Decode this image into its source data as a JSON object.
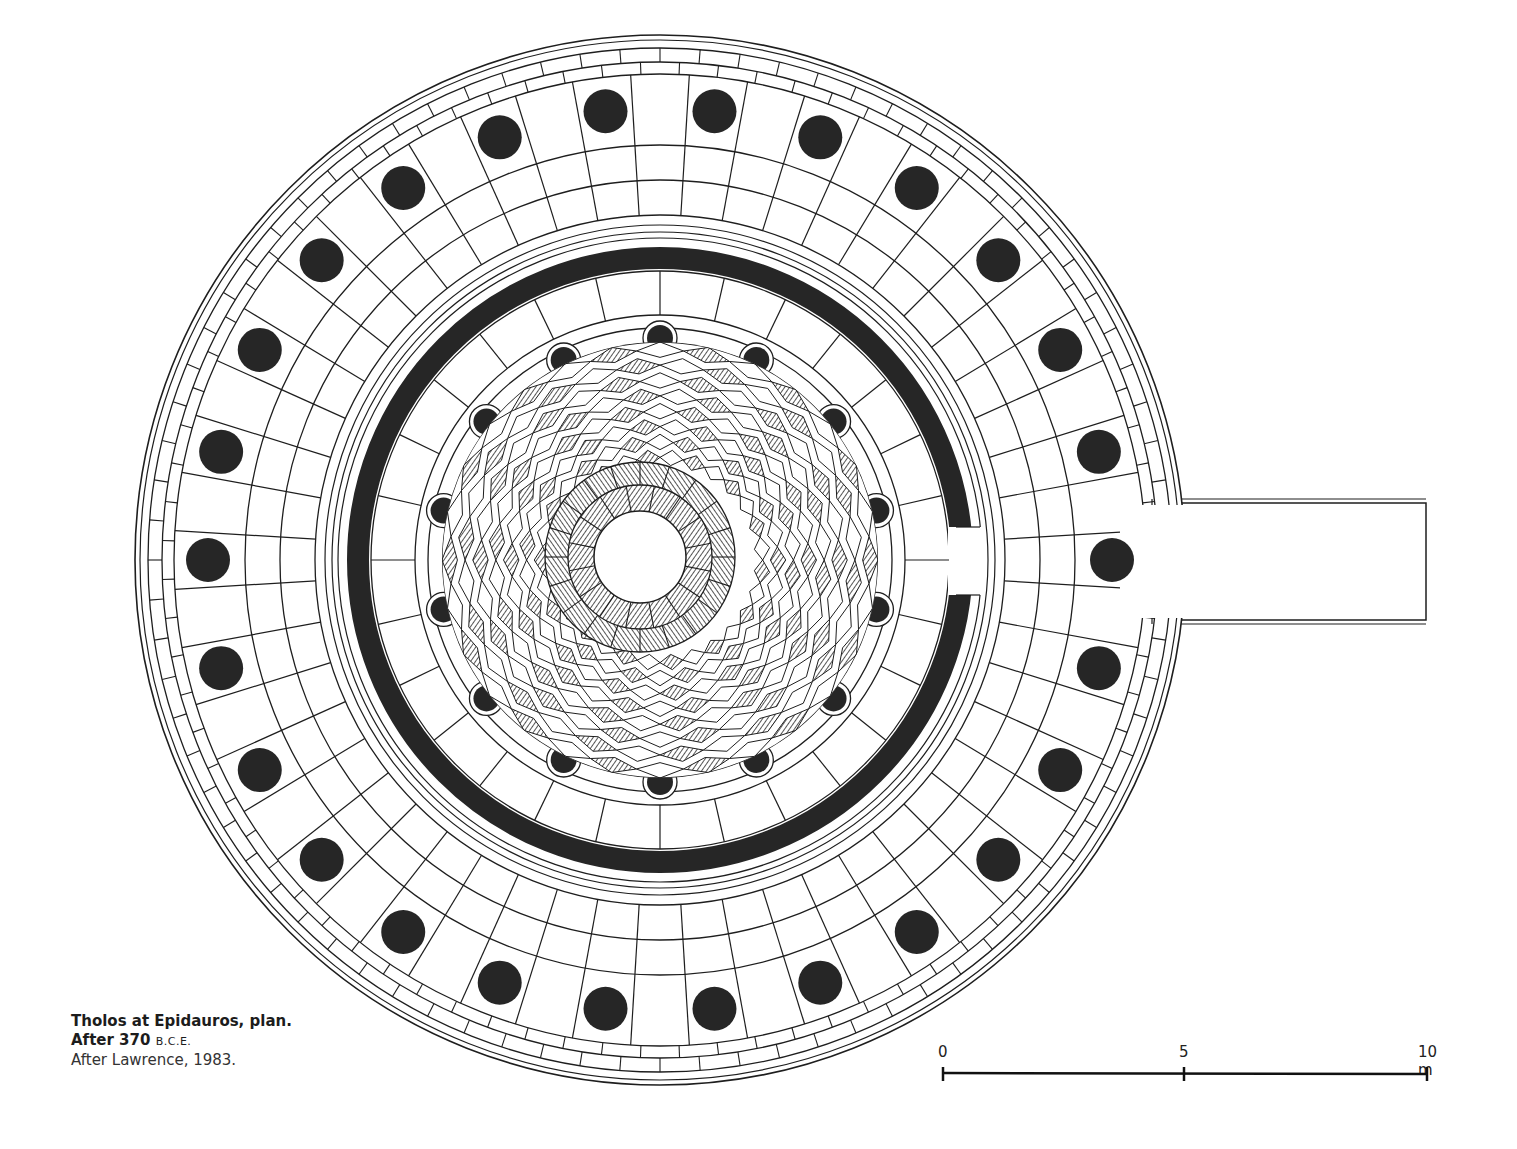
{
  "figure": {
    "title": "Tholos at Epidauros, plan",
    "type": "architectural-plan",
    "colors": {
      "ink": "#1a1a1a",
      "paper": "#ffffff",
      "fill": "#262626"
    }
  },
  "caption": {
    "line1": "Tholos at Epidauros, plan.",
    "line2_prefix": "After 370",
    "line2_era": "B.C.E.",
    "line3": "After Lawrence, 1983."
  },
  "scale_bar": {
    "labels": [
      "0",
      "5",
      "10 m"
    ],
    "units": "m",
    "ticks": [
      0,
      5,
      10
    ]
  },
  "plan": {
    "outer_columns": 26,
    "inner_columns": 14,
    "elements": [
      "outer-peristyle",
      "cella-wall",
      "inner-colonnade",
      "checkered-floor",
      "central-opening",
      "entrance-ramp"
    ]
  }
}
